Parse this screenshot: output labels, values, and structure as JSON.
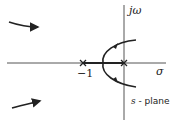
{
  "diagram": {
    "type": "root-locus",
    "labels": {
      "imag_axis": "jω",
      "real_axis": "σ",
      "pole_neg1": "−1",
      "plane_var": "s",
      "plane_text": " - plane"
    },
    "poles": [
      {
        "real": -1,
        "imag": 0,
        "marker": "×"
      },
      {
        "real": 0,
        "imag": 0,
        "marker": "×"
      }
    ],
    "colors": {
      "line": "#222222",
      "axis": "#555555"
    }
  }
}
